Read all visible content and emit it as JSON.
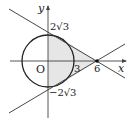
{
  "diagram": {
    "axes": {
      "x_label": "x",
      "y_label": "y",
      "origin_label": "O"
    },
    "circle": {
      "center": [
        0,
        0
      ],
      "radius": "2√3"
    },
    "point": {
      "label": "6",
      "coords": [
        6,
        0
      ]
    },
    "labels": {
      "y_top": "2√3",
      "y_bottom": "−2√3",
      "x_three": "3",
      "x_six": "6"
    },
    "colors": {
      "stroke": "#222222",
      "shade": "#e6e6e6"
    }
  }
}
